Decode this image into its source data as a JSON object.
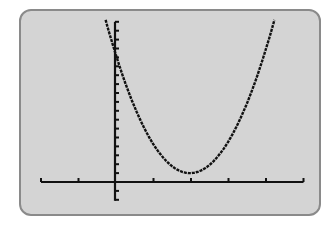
{
  "screen": {
    "background": "#d4d4d4",
    "border": "#8a8a8a",
    "ink": "#111111"
  },
  "chart_data": {
    "type": "line",
    "title": "",
    "xlabel": "",
    "ylabel": "",
    "xlim": [
      -2,
      5
    ],
    "ylim": [
      -2,
      18
    ],
    "x_tick_step": 1,
    "y_tick_step": 1,
    "grid": false,
    "legend": null,
    "series": [
      {
        "name": "parabola",
        "equation_estimate": "y = 3.4(x - 2)^2 + 1",
        "vertex": [
          2,
          1
        ],
        "x": [
          -0.25,
          0,
          0.5,
          1,
          1.5,
          2,
          2.5,
          3,
          3.5,
          4,
          4.25
        ],
        "y": [
          18.2,
          14.6,
          8.65,
          4.4,
          1.85,
          1,
          1.85,
          4.4,
          8.65,
          14.6,
          18.2
        ]
      }
    ]
  }
}
